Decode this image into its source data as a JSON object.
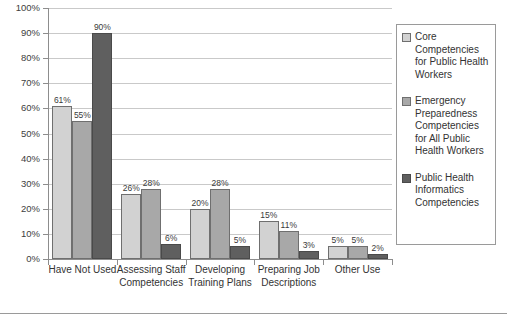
{
  "chart_data": {
    "type": "bar",
    "title": "",
    "xlabel": "",
    "ylabel": "",
    "ylim": [
      0,
      100
    ],
    "ytick_step": 10,
    "grid": true,
    "legend_position": "right",
    "categories": [
      "Have Not Used",
      "Assessing Staff Competencies",
      "Developing Training Plans",
      "Preparing Job Descriptions",
      "Other Use"
    ],
    "ytick_labels": [
      "0%",
      "10%",
      "20%",
      "30%",
      "40%",
      "50%",
      "60%",
      "70%",
      "80%",
      "90%",
      "100%"
    ],
    "ytick_values": [
      0,
      10,
      20,
      30,
      40,
      50,
      60,
      70,
      80,
      90,
      100
    ],
    "series": [
      {
        "name": "Core Competencies for Public Health Workers",
        "color": "#d2d2d2",
        "values": [
          61,
          26,
          20,
          15,
          5
        ],
        "labels": [
          "61%",
          "26%",
          "20%",
          "15%",
          "5%"
        ]
      },
      {
        "name": "Emergency Preparedness Competencies for All Public Health Workers",
        "color": "#a8a8a8",
        "values": [
          55,
          28,
          28,
          11,
          5
        ],
        "labels": [
          "55%",
          "28%",
          "28%",
          "11%",
          "5%"
        ]
      },
      {
        "name": "Public Health Informatics Competencies",
        "color": "#5f5f5f",
        "values": [
          90,
          6,
          5,
          3,
          2
        ],
        "labels": [
          "90%",
          "6%",
          "5%",
          "3%",
          "2%"
        ]
      }
    ]
  },
  "legend": {
    "entries": [
      "Core Competencies for Public Health Workers",
      "Emergency Preparedness Competencies for All Public Health Workers",
      "Public Health Informatics Competencies"
    ]
  }
}
